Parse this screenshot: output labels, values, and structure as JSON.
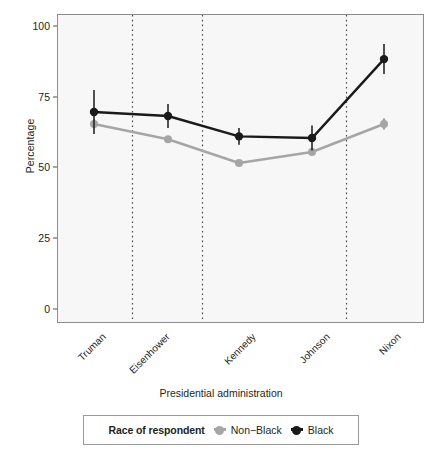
{
  "chart_data": {
    "type": "line",
    "title": "",
    "subtitle": "",
    "xlabel": "Presidential administration",
    "ylabel": "Percentage",
    "categories": [
      "Truman",
      "Eisenhower",
      "Kennedy",
      "Johnson",
      "Nixon"
    ],
    "xtick_labels": [
      "Truman",
      "Eisenhower",
      "Kennedy",
      "Johnson",
      "Nixon"
    ],
    "ytick_labels": [
      "0",
      "25",
      "50",
      "75",
      "100"
    ],
    "ytick_values": [
      0,
      25,
      50,
      75,
      100
    ],
    "ylim": [
      0,
      100
    ],
    "grid": false,
    "legend_position": "bottom",
    "legend_title": "Race of respondent",
    "vertical_reference_lines": {
      "style": "dotted",
      "between_categories": [
        "Truman|Eisenhower",
        "Eisenhower|Kennedy",
        "Johnson|Nixon"
      ]
    },
    "series": [
      {
        "name": "Non−Black",
        "color": "#a6a6a6",
        "values": [
          65.4,
          60.0,
          51.6,
          55.5,
          65.4
        ],
        "error_low": [
          63.8,
          58.9,
          50.6,
          54.4,
          63.4
        ],
        "error_high": [
          67.0,
          61.1,
          52.6,
          56.6,
          67.4
        ]
      },
      {
        "name": "Black",
        "color": "#1a1a1a",
        "values": [
          69.6,
          68.2,
          61.0,
          60.4,
          88.3
        ],
        "error_low": [
          61.8,
          64.0,
          58.0,
          56.0,
          83.0
        ],
        "error_high": [
          77.4,
          72.4,
          64.0,
          64.8,
          93.6
        ]
      }
    ]
  },
  "axis": {
    "ylabel": "Percentage",
    "xlabel": "Presidential administration"
  },
  "legend": {
    "title": "Race of respondent",
    "entries": [
      {
        "label": "Non−Black",
        "color": "#a6a6a6"
      },
      {
        "label": "Black",
        "color": "#1a1a1a"
      }
    ]
  },
  "colors": {
    "panel_background": "#f7f7f7",
    "panel_border": "#8c8c8c",
    "text": "#231f20",
    "non_black_series": "#a6a6a6",
    "black_series": "#1a1a1a",
    "reference_line": "#4d4d4d"
  }
}
